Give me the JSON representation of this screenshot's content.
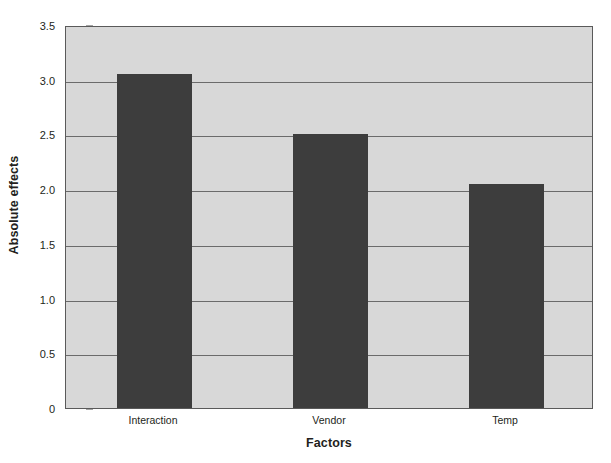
{
  "chart_data": {
    "type": "bar",
    "title": "",
    "subtitle": "",
    "categories": [
      "Interaction",
      "Vendor",
      "Temp"
    ],
    "values": [
      3.05,
      2.5,
      2.05
    ],
    "series": [
      {
        "name": "Absolute effects",
        "values": [
          3.05,
          2.5,
          2.05
        ]
      }
    ],
    "xlabel": "Factors",
    "ylabel": "Absolute effects",
    "ylim": [
      0,
      3.5
    ],
    "ytick_values": [
      0,
      0.5,
      1.0,
      1.5,
      2.0,
      2.5,
      3.0,
      3.5
    ],
    "ytick_labels": [
      "0",
      "0.5",
      "1.0",
      "1.5",
      "2.0",
      "2.5",
      "3.0",
      "3.5"
    ],
    "grid": true,
    "grid_axis": "y",
    "legend": false,
    "legend_position": "none",
    "bar_color": "#3d3d3d",
    "plot_background": "#d8d8d8",
    "figure_background": "#ffffff",
    "grid_color": "#6b6b6b",
    "axis_color": "#5a5a5a",
    "text_color": "#231f20"
  }
}
